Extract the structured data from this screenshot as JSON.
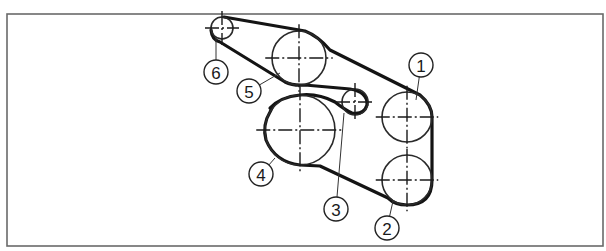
{
  "caption": "(accessory drive belt routing diagram)",
  "frame": {
    "x": 7,
    "y": 14,
    "width": 596,
    "height": 232,
    "color": "#6a6a6a"
  },
  "pulleys": [
    {
      "id": "1",
      "cx": 407,
      "cy": 117,
      "r": 25
    },
    {
      "id": "2",
      "cx": 407,
      "cy": 180,
      "r": 25
    },
    {
      "id": "3",
      "cx": 355,
      "cy": 102,
      "r": 13
    },
    {
      "id": "4",
      "cx": 300,
      "cy": 130,
      "r": 35
    },
    {
      "id": "5",
      "cx": 299,
      "cy": 58,
      "r": 27
    },
    {
      "id": "6",
      "cx": 222,
      "cy": 28,
      "r": 11
    }
  ],
  "labels": [
    {
      "text": "1",
      "cx": 421,
      "cy": 65,
      "r": 12,
      "leader_to": [
        416,
        100
      ]
    },
    {
      "text": "2",
      "cx": 387,
      "cy": 228,
      "r": 12,
      "leader_to": [
        393,
        201
      ]
    },
    {
      "text": "3",
      "cx": 336,
      "cy": 209,
      "r": 12,
      "leader_to": [
        344,
        113
      ]
    },
    {
      "text": "4",
      "cx": 261,
      "cy": 174,
      "r": 12,
      "leader_to": [
        275,
        158
      ]
    },
    {
      "text": "5",
      "cx": 249,
      "cy": 91,
      "r": 12,
      "leader_to": [
        280,
        73
      ]
    },
    {
      "text": "6",
      "cx": 216,
      "cy": 72,
      "r": 12,
      "leader_to": [
        216,
        38
      ]
    }
  ],
  "colors": {
    "belt": "#141414",
    "pulley": "#2a2a2a",
    "background": "#ffffff"
  }
}
